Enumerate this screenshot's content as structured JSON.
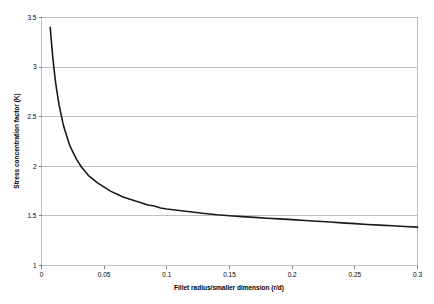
{
  "chart_data": {
    "type": "line",
    "title": "",
    "xlabel": "Fillet radius/smaller dimension (r/d)",
    "ylabel": "Stress concentration factor (K)",
    "xlim": [
      0,
      0.3
    ],
    "ylim": [
      1,
      3.5
    ],
    "xticks": [
      0,
      0.05,
      0.1,
      0.15,
      0.2,
      0.25,
      0.3
    ],
    "xticklabels": [
      "0",
      "0.05",
      "0.1",
      "0.15",
      "0.2",
      "0.25",
      "0.3"
    ],
    "yticks": [
      1,
      1.5,
      2,
      2.5,
      3,
      3.5
    ],
    "yticklabels": [
      "1",
      "1.5",
      "2",
      "2.5",
      "3",
      "3.5"
    ],
    "grid": "horizontal",
    "legend": "none",
    "series": [
      {
        "name": "Stress concentration factor",
        "color": "#1a1a1a",
        "x": [
          0.007,
          0.008,
          0.009,
          0.01,
          0.011,
          0.012,
          0.013,
          0.014,
          0.015,
          0.016,
          0.017,
          0.018,
          0.019,
          0.02,
          0.022,
          0.024,
          0.026,
          0.028,
          0.03,
          0.032,
          0.034,
          0.036,
          0.038,
          0.04,
          0.045,
          0.05,
          0.055,
          0.06,
          0.065,
          0.07,
          0.075,
          0.08,
          0.085,
          0.09,
          0.095,
          0.1,
          0.11,
          0.12,
          0.13,
          0.14,
          0.15,
          0.16,
          0.17,
          0.18,
          0.19,
          0.2,
          0.21,
          0.22,
          0.23,
          0.24,
          0.25,
          0.26,
          0.27,
          0.28,
          0.29,
          0.3
        ],
        "y": [
          3.4,
          3.24,
          3.1,
          2.98,
          2.87,
          2.78,
          2.7,
          2.62,
          2.56,
          2.5,
          2.44,
          2.39,
          2.35,
          2.31,
          2.23,
          2.17,
          2.12,
          2.07,
          2.03,
          1.99,
          1.96,
          1.93,
          1.9,
          1.88,
          1.83,
          1.79,
          1.75,
          1.72,
          1.69,
          1.67,
          1.65,
          1.63,
          1.61,
          1.6,
          1.58,
          1.57,
          1.555,
          1.54,
          1.525,
          1.512,
          1.502,
          1.493,
          1.485,
          1.477,
          1.47,
          1.462,
          1.454,
          1.446,
          1.438,
          1.43,
          1.422,
          1.414,
          1.407,
          1.4,
          1.393,
          1.387
        ]
      }
    ]
  },
  "style": {
    "grid_color": "#c0c0c0",
    "border_color": "#c0c0c0",
    "axis_color": "#808080",
    "curve_color": "#1a1a1a",
    "text_color": "#000000",
    "plot_background": "#ffffff"
  }
}
